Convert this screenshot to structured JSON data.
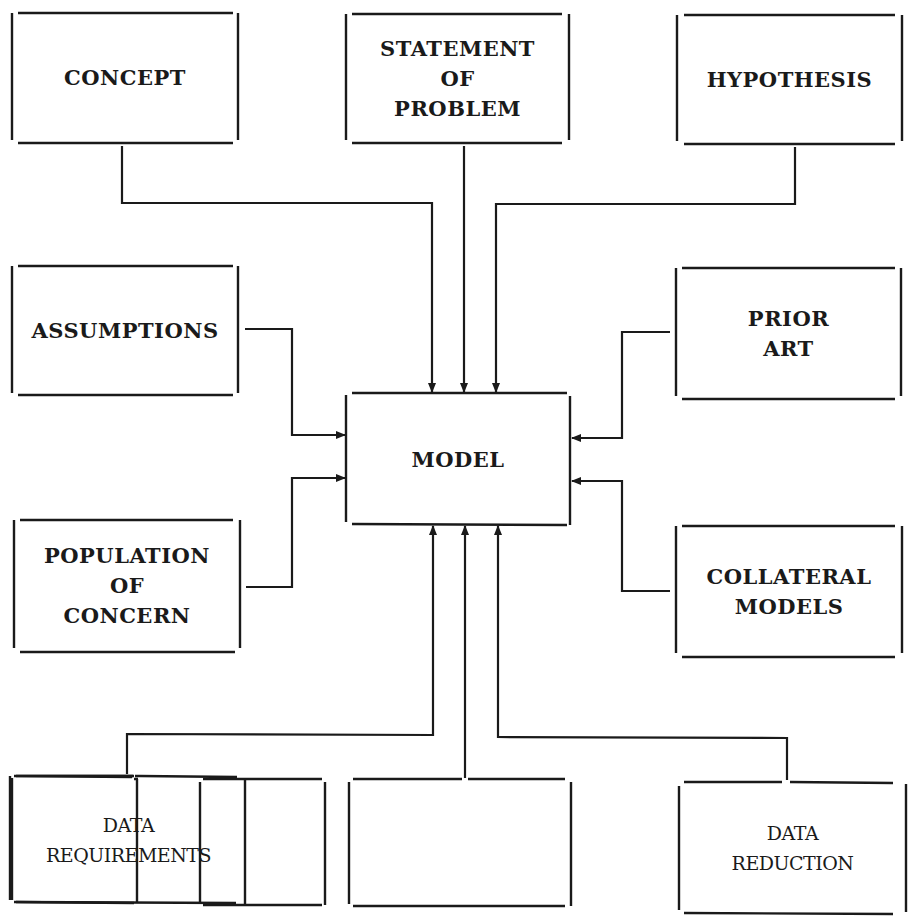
{
  "diagram": {
    "type": "block diagram",
    "center": {
      "label": "MODEL"
    },
    "boxes": {
      "concept": {
        "label": "CONCEPT"
      },
      "statement": {
        "label": "STATEMENT\nOF\nPROBLEM"
      },
      "hypothesis": {
        "label": "HYPOTHESIS"
      },
      "assumptions": {
        "label": "ASSUMPTIONS"
      },
      "prior_art": {
        "label": "PRIOR\nART"
      },
      "population": {
        "label": "POPULATION\nOF\nCONCERN"
      },
      "collateral": {
        "label": "COLLATERAL\nMODELS"
      },
      "data_requirements": {
        "label": "DATA\nREQUIREMENTS"
      },
      "blank": {
        "label": ""
      },
      "data_reduction": {
        "label": "DATA\nREDUCTION"
      }
    },
    "edges": [
      {
        "from": "CONCEPT",
        "to": "MODEL"
      },
      {
        "from": "STATEMENT OF PROBLEM",
        "to": "MODEL"
      },
      {
        "from": "HYPOTHESIS",
        "to": "MODEL"
      },
      {
        "from": "ASSUMPTIONS",
        "to": "MODEL"
      },
      {
        "from": "POPULATION OF CONCERN",
        "to": "MODEL"
      },
      {
        "from": "PRIOR ART",
        "to": "MODEL"
      },
      {
        "from": "COLLATERAL MODELS",
        "to": "MODEL"
      },
      {
        "from": "DATA REQUIREMENTS",
        "to": "MODEL"
      },
      {
        "from": "(blank box)",
        "to": "MODEL"
      },
      {
        "from": "DATA REDUCTION",
        "to": "MODEL"
      }
    ]
  }
}
